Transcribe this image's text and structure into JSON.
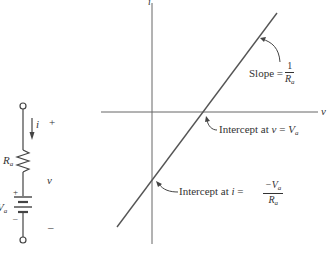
{
  "circuit": {
    "current_label": "i",
    "resistor_label": "R",
    "resistor_sub": "a",
    "voltage_label": "v",
    "source_label": "V",
    "source_sub": "a",
    "plus_top": "+",
    "minus_bottom": "–",
    "battery_plus": "+",
    "battery_minus": "–"
  },
  "graph": {
    "x_axis_label": "v",
    "y_axis_label": "i",
    "slope_text": "Slope = ",
    "slope_num": "1",
    "slope_den": "R",
    "slope_den_sub": "a",
    "v_intercept_text": "Intercept at ",
    "v_intercept_var": "v",
    "v_intercept_eq": " = ",
    "v_intercept_val": "V",
    "v_intercept_sub": "a",
    "i_intercept_text": "Intercept at ",
    "i_intercept_var": "i",
    "i_intercept_eq": " = ",
    "i_intercept_num": "−V",
    "i_intercept_num_sub": "a",
    "i_intercept_den": "R",
    "i_intercept_den_sub": "a"
  },
  "colors": {
    "ink": "#333333",
    "line": "#555555",
    "background": "#ffffff"
  }
}
